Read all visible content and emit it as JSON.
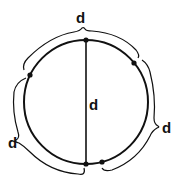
{
  "diagram": {
    "labels": {
      "diameter": "d",
      "arc_top": "d",
      "arc_right": "d",
      "arc_left": "d"
    },
    "colors": {
      "stroke": "#111111",
      "background": "#ffffff"
    }
  }
}
